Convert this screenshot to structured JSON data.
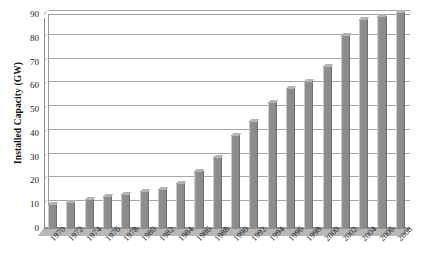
{
  "chart_data": {
    "type": "bar",
    "title": "",
    "xlabel": "",
    "ylabel": "Installed Capacity (GW)",
    "ylim": [
      0,
      90
    ],
    "ytick_step": 10,
    "yticks": [
      0,
      10,
      20,
      30,
      40,
      50,
      60,
      70,
      80,
      90
    ],
    "grid": true,
    "legend": "none",
    "style": "3d-bar",
    "bar_color": "#8a8a8a",
    "background_color": "#ffffff",
    "categories": [
      "1970",
      "1972",
      "1974",
      "1976",
      "1978",
      "1980",
      "1982",
      "1984",
      "1986",
      "1988",
      "1990",
      "1992",
      "1994",
      "1996",
      "1998",
      "2000",
      "2002",
      "2004",
      "2006",
      "2008"
    ],
    "values": [
      10,
      11,
      12,
      13.5,
      14.5,
      15.5,
      16.5,
      19,
      24,
      30,
      39,
      45,
      53,
      59,
      62,
      68,
      81,
      88,
      89,
      91
    ]
  }
}
